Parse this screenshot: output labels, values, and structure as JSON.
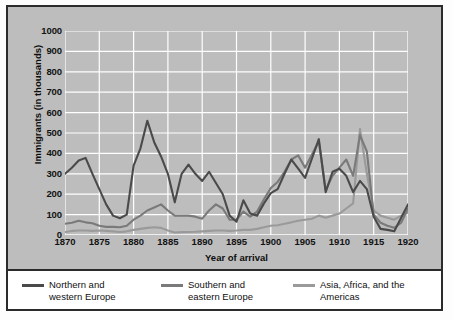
{
  "chart_data": {
    "type": "line",
    "title": "",
    "xlabel": "Year of arrival",
    "ylabel": "Immigrants (in thousands)",
    "xlim": [
      1870,
      1920
    ],
    "ylim": [
      0,
      1000
    ],
    "grid": true,
    "legend_position": "bottom",
    "xticks": [
      "1870",
      "1875",
      "1880",
      "1885",
      "1890",
      "1895",
      "1900",
      "1905",
      "1910",
      "1915",
      "1920"
    ],
    "yticks": [
      "0",
      "100",
      "200",
      "300",
      "400",
      "500",
      "600",
      "700",
      "800",
      "900",
      "1000"
    ],
    "x": [
      1870,
      1871,
      1872,
      1873,
      1874,
      1875,
      1876,
      1877,
      1878,
      1879,
      1880,
      1881,
      1882,
      1883,
      1884,
      1885,
      1886,
      1887,
      1888,
      1889,
      1890,
      1891,
      1892,
      1893,
      1894,
      1895,
      1896,
      1897,
      1898,
      1899,
      1900,
      1901,
      1902,
      1903,
      1904,
      1905,
      1906,
      1907,
      1908,
      1909,
      1910,
      1911,
      1912,
      1913,
      1914,
      1915,
      1916,
      1917,
      1918,
      1919,
      1920
    ],
    "series": [
      {
        "name": "Northern and western Europe",
        "color": "#4a4a4a",
        "values": [
          300,
          330,
          365,
          378,
          300,
          225,
          150,
          95,
          82,
          100,
          340,
          425,
          560,
          455,
          385,
          300,
          160,
          300,
          345,
          300,
          265,
          310,
          255,
          200,
          95,
          65,
          170,
          105,
          95,
          155,
          205,
          225,
          300,
          370,
          325,
          280,
          375,
          470,
          210,
          310,
          325,
          290,
          210,
          265,
          225,
          90,
          30,
          25,
          18,
          85,
          150
        ]
      },
      {
        "name": "Southern and eastern Europe",
        "color": "#7a7a7a",
        "values": [
          55,
          60,
          70,
          62,
          58,
          45,
          40,
          40,
          38,
          45,
          75,
          95,
          120,
          135,
          150,
          120,
          95,
          95,
          95,
          90,
          80,
          120,
          150,
          130,
          75,
          75,
          115,
          90,
          115,
          175,
          230,
          260,
          310,
          370,
          390,
          330,
          395,
          460,
          220,
          290,
          330,
          370,
          290,
          490,
          410,
          100,
          60,
          45,
          35,
          60,
          130
        ]
      },
      {
        "name": "Asia, Africa, and the Americas",
        "color": "#9a9a9a",
        "values": [
          15,
          20,
          22,
          22,
          20,
          22,
          20,
          18,
          15,
          18,
          25,
          30,
          35,
          38,
          35,
          22,
          12,
          14,
          15,
          16,
          18,
          20,
          22,
          22,
          20,
          22,
          25,
          25,
          30,
          38,
          45,
          48,
          55,
          62,
          70,
          75,
          80,
          95,
          85,
          95,
          105,
          130,
          155,
          520,
          300,
          120,
          95,
          85,
          75,
          95,
          110
        ]
      }
    ]
  },
  "legend": {
    "items": [
      {
        "label": "Northern and\nwestern Europe"
      },
      {
        "label": "Southern and\neastern Europe"
      },
      {
        "label": "Asia, Africa, and the Americas"
      }
    ]
  },
  "colors": {
    "plot_background": "#bdbdbd",
    "gridline": "#ffffff",
    "border": "#2b2b2b",
    "legend_background": "#ffffff",
    "text": "#101010"
  }
}
